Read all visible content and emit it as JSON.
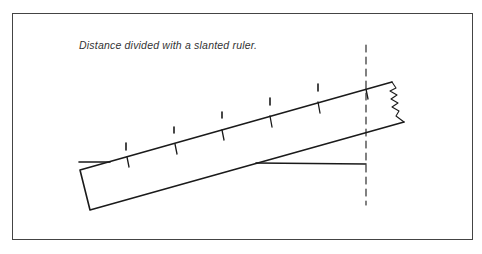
{
  "diagram": {
    "caption": "Distance divided with a slanted ruler.",
    "colors": {
      "stroke": "#1a1a1a",
      "frame": "#444444",
      "background": "#ffffff"
    },
    "divisions": 6,
    "elements": [
      "frame",
      "baseline",
      "slanted-ruler",
      "dashed-end-line",
      "division-ticks",
      "ruler-ticks",
      "torn-end"
    ]
  }
}
